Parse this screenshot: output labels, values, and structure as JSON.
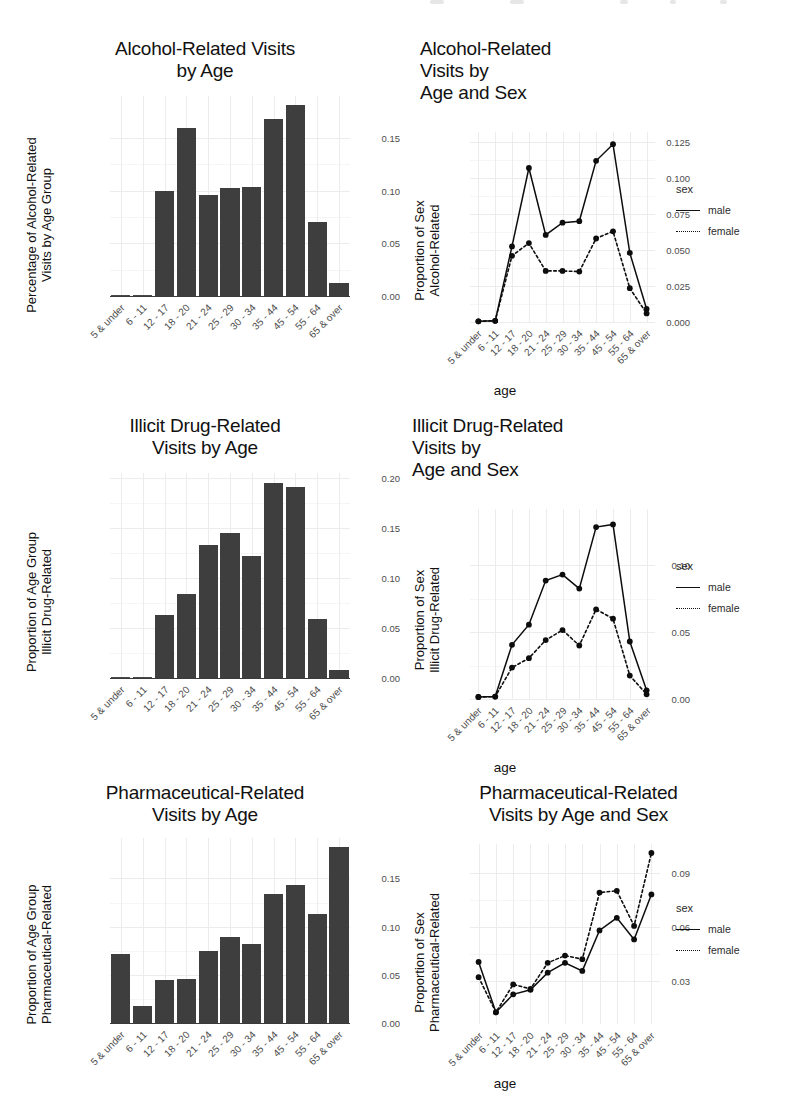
{
  "figure": {
    "axis_label_x": "age",
    "legend": {
      "title": "sex",
      "items": [
        {
          "label": "male",
          "style": "solid"
        },
        {
          "label": "female",
          "style": "dotted"
        }
      ]
    },
    "age_groups": [
      "5 & under",
      "6 - 11",
      "12 - 17",
      "18 - 20",
      "21 - 24",
      "25 - 29",
      "30 - 34",
      "35 - 44",
      "45 - 54",
      "55 - 64",
      "65 & over"
    ]
  },
  "chart_data": [
    {
      "id": "alcohol-by-age",
      "type": "bar",
      "title": "Alcohol-Related Visits by Age",
      "title_lines": [
        "Alcohol-Related Visits",
        "by Age"
      ],
      "ylabel": "Percentage of Alcohol-Related Visits by Age Group",
      "ylabel_lines": [
        "Percentage of Alcohol-Related",
        "Visits by Age Group"
      ],
      "xlabel": "",
      "categories": [
        "5 & under",
        "6 - 11",
        "12 - 17",
        "18 - 20",
        "21 - 24",
        "25 - 29",
        "30 - 34",
        "35 - 44",
        "45 - 54",
        "55 - 64",
        "65 & over"
      ],
      "values": [
        0.0,
        0.001,
        0.1,
        0.16,
        0.096,
        0.103,
        0.104,
        0.168,
        0.181,
        0.07,
        0.012
      ],
      "yticks": [
        0.0,
        0.05,
        0.1,
        0.15
      ],
      "ytick_labels": [
        "0.00",
        "0.05",
        "0.10",
        "0.15"
      ],
      "ylim": [
        0,
        0.19
      ],
      "grid": true
    },
    {
      "id": "alcohol-by-age-sex",
      "type": "line",
      "title": "Alcohol-Related Visits by Age and Sex",
      "title_lines": [
        "Alcohol-Related",
        "Visits by",
        "Age and Sex"
      ],
      "ylabel": "Proportion of Sex Alcohol-Related",
      "ylabel_lines": [
        "Proportion of Sex",
        "Alcohol-Related"
      ],
      "xlabel": "age",
      "categories": [
        "5 & under",
        "6 - 11",
        "12 - 17",
        "18 - 20",
        "21 - 24",
        "25 - 29",
        "30 - 34",
        "35 - 44",
        "45 - 54",
        "55 - 64",
        "65 & over"
      ],
      "series": [
        {
          "name": "male",
          "style": "solid",
          "values": [
            0.0005,
            0.0008,
            0.0525,
            0.107,
            0.0605,
            0.069,
            0.07,
            0.112,
            0.1235,
            0.048,
            0.009
          ]
        },
        {
          "name": "female",
          "style": "dotted",
          "values": [
            0.0005,
            0.0008,
            0.046,
            0.0548,
            0.0355,
            0.0355,
            0.035,
            0.058,
            0.063,
            0.0235,
            0.006
          ]
        }
      ],
      "yticks": [
        0.0,
        0.025,
        0.05,
        0.075,
        0.1,
        0.125
      ],
      "ytick_labels": [
        "0.000",
        "0.025",
        "0.050",
        "0.075",
        "0.100",
        "0.125"
      ],
      "ylim": [
        0,
        0.132
      ],
      "grid": true
    },
    {
      "id": "illicit-by-age",
      "type": "bar",
      "title": "Illicit Drug-Related Visits by Age",
      "title_lines": [
        "Illicit Drug-Related",
        "Visits by Age"
      ],
      "ylabel": "Proportion of Age Group Illicit Drug-Related",
      "ylabel_lines": [
        "Proportion of Age Group",
        "Illicit Drug-Related"
      ],
      "xlabel": "",
      "categories": [
        "5 & under",
        "6 - 11",
        "12 - 17",
        "18 - 20",
        "21 - 24",
        "25 - 29",
        "30 - 34",
        "35 - 44",
        "45 - 54",
        "55 - 64",
        "65 & over"
      ],
      "values": [
        0.0,
        0.0008,
        0.063,
        0.084,
        0.133,
        0.145,
        0.122,
        0.195,
        0.191,
        0.059,
        0.008
      ],
      "yticks": [
        0.0,
        0.05,
        0.1,
        0.15,
        0.2
      ],
      "ytick_labels": [
        "0.00",
        "0.05",
        "0.10",
        "0.15",
        "0.20"
      ],
      "ylim": [
        0,
        0.205
      ],
      "grid": true
    },
    {
      "id": "illicit-by-age-sex",
      "type": "line",
      "title": "Illicit Drug-Related Visits by Age and Sex",
      "title_lines": [
        "Illicit Drug-Related",
        "Visits by",
        "Age and Sex"
      ],
      "ylabel": "Proportion of Sex Illicit Drug-Related",
      "ylabel_lines": [
        "Proportion of Sex",
        "Illicit Drug-Related"
      ],
      "xlabel": "age",
      "categories": [
        "5 & under",
        "6 - 11",
        "12 - 17",
        "18 - 20",
        "21 - 24",
        "25 - 29",
        "30 - 34",
        "35 - 44",
        "45 - 54",
        "55 - 64",
        "65 & over"
      ],
      "series": [
        {
          "name": "male",
          "style": "solid",
          "values": [
            0.0015,
            0.0018,
            0.0405,
            0.0555,
            0.0885,
            0.093,
            0.0825,
            0.1285,
            0.1305,
            0.043,
            0.0065
          ]
        },
        {
          "name": "female",
          "style": "dotted",
          "values": [
            0.0015,
            0.0018,
            0.0235,
            0.0305,
            0.044,
            0.0515,
            0.04,
            0.067,
            0.06,
            0.0175,
            0.0035
          ]
        }
      ],
      "yticks": [
        0.0,
        0.05,
        0.1
      ],
      "ytick_labels": [
        "0.00",
        "0.05",
        "0.10"
      ],
      "ylim": [
        0,
        0.142
      ],
      "grid": true
    },
    {
      "id": "pharma-by-age",
      "type": "bar",
      "title": "Pharmaceutical-Related Visits by Age",
      "title_lines": [
        "Pharmaceutical-Related",
        "Visits by Age"
      ],
      "ylabel": "Proportion of Age Group Pharmaceutical-Related",
      "ylabel_lines": [
        "Proportion of Age Group",
        "Pharmaceutical-Related"
      ],
      "xlabel": "",
      "categories": [
        "5 & under",
        "6 - 11",
        "12 - 17",
        "18 - 20",
        "21 - 24",
        "25 - 29",
        "30 - 34",
        "35 - 44",
        "45 - 54",
        "55 - 64",
        "65 & over"
      ],
      "values": [
        0.072,
        0.018,
        0.045,
        0.046,
        0.075,
        0.089,
        0.082,
        0.134,
        0.143,
        0.113,
        0.183
      ],
      "yticks": [
        0.0,
        0.05,
        0.1,
        0.15
      ],
      "ytick_labels": [
        "0.00",
        "0.05",
        "0.10",
        "0.15"
      ],
      "ylim": [
        0,
        0.192
      ],
      "grid": true
    },
    {
      "id": "pharma-by-age-sex",
      "type": "line",
      "title": "Pharmaceutical-Related Visits by Age and Sex",
      "title_lines": [
        "Pharmaceutical-Related",
        "Visits by Age and Sex"
      ],
      "ylabel": "Proportion of Sex Pharmaceutical-Related",
      "ylabel_lines": [
        "Proportion of Sex",
        "Pharmaceutical-Related"
      ],
      "xlabel": "age",
      "categories": [
        "5 & under",
        "6 - 11",
        "12 - 17",
        "18 - 20",
        "21 - 24",
        "25 - 29",
        "30 - 34",
        "35 - 44",
        "45 - 54",
        "55 - 64",
        "65 & over"
      ],
      "series": [
        {
          "name": "male",
          "style": "solid",
          "values": [
            0.0405,
            0.0125,
            0.0225,
            0.025,
            0.0345,
            0.04,
            0.0355,
            0.058,
            0.065,
            0.053,
            0.078
          ]
        },
        {
          "name": "female",
          "style": "dotted",
          "values": [
            0.032,
            0.0125,
            0.028,
            0.0255,
            0.04,
            0.044,
            0.042,
            0.079,
            0.08,
            0.0605,
            0.101
          ]
        }
      ],
      "yticks": [
        0.03,
        0.06,
        0.09
      ],
      "ytick_labels": [
        "0.03",
        "0.06",
        "0.09"
      ],
      "ylim": [
        0.006,
        0.106
      ],
      "grid": true
    }
  ]
}
